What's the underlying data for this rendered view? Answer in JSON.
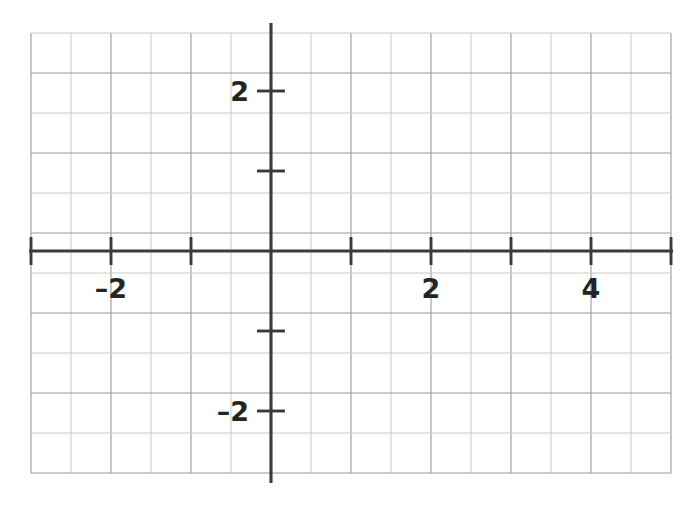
{
  "figure": {
    "title": "",
    "width": 698,
    "height": 514,
    "background_color": "#ffffff"
  },
  "chart_data": {
    "type": "line",
    "title": "",
    "subtitle": "",
    "xlabel": "",
    "ylabel": "",
    "xlim": [
      -3.0,
      5.0
    ],
    "ylim": [
      -2.725,
      2.725
    ],
    "grid": true,
    "grid_spacing_units": 0.5,
    "legend": null,
    "series": [],
    "x": [],
    "values": [],
    "x_axis": {
      "tick_values": [
        -3,
        -2,
        -1,
        1,
        2,
        3,
        4,
        5
      ],
      "labeled_ticks": [
        {
          "value": -2,
          "label": "–2"
        },
        {
          "value": 2,
          "label": "2"
        },
        {
          "value": 4,
          "label": "4"
        }
      ]
    },
    "y_axis": {
      "tick_values": [
        -2,
        -1,
        1,
        2
      ],
      "labeled_ticks": [
        {
          "value": 2,
          "label": "2"
        },
        {
          "value": -2,
          "label": "–2"
        }
      ]
    },
    "origin": {
      "x": 0,
      "y": 0
    }
  },
  "geometry": {
    "origin_px": {
      "x": 271,
      "y": 251
    },
    "unit_px": 80,
    "grid_cell_px": 40,
    "plot_left_px": 31,
    "plot_right_px": 671,
    "plot_top_px": 33,
    "plot_bottom_px": 473,
    "tick_half_length_px": 14
  },
  "colors": {
    "axis": "#3b3b3b",
    "grid_major": "#9a9a9a",
    "grid_minor": "#c8c8c8",
    "label": "#242424",
    "background": "#ffffff"
  },
  "labels": {
    "y_positive_two": "2",
    "y_negative_two": "–2",
    "x_negative_two": "–2",
    "x_positive_two": "2",
    "x_positive_four": "4"
  }
}
